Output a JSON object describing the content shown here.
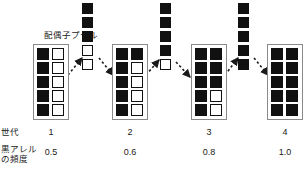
{
  "figure": {
    "title_label": "配偶子プール",
    "row_labels": {
      "generation": "世代",
      "allele_freq_line1": "黒アレル",
      "allele_freq_line2": "の頻度"
    }
  },
  "chart_data": {
    "type": "diagram",
    "title": "配偶子プール",
    "generations": [
      {
        "index": "1",
        "generation_label": "1",
        "black_allele_frequency": "0.5",
        "frequency_value": 0.5,
        "rows": [
          [
            "black",
            "white"
          ],
          [
            "black",
            "white"
          ],
          [
            "black",
            "white"
          ],
          [
            "black",
            "white"
          ],
          [
            "black",
            "white"
          ]
        ]
      },
      {
        "index": "2",
        "generation_label": "2",
        "black_allele_frequency": "0.6",
        "frequency_value": 0.6,
        "rows": [
          [
            "black",
            "black"
          ],
          [
            "black",
            "white"
          ],
          [
            "black",
            "white"
          ],
          [
            "black",
            "white"
          ],
          [
            "black",
            "white"
          ]
        ]
      },
      {
        "index": "3",
        "generation_label": "3",
        "black_allele_frequency": "0.8",
        "frequency_value": 0.8,
        "rows": [
          [
            "black",
            "black"
          ],
          [
            "black",
            "black"
          ],
          [
            "black",
            "black"
          ],
          [
            "black",
            "white"
          ],
          [
            "black",
            "white"
          ]
        ]
      },
      {
        "index": "4",
        "generation_label": "4",
        "black_allele_frequency": "1.0",
        "frequency_value": 1.0,
        "rows": [
          [
            "black",
            "black"
          ],
          [
            "black",
            "black"
          ],
          [
            "black",
            "black"
          ],
          [
            "black",
            "black"
          ],
          [
            "black",
            "black"
          ]
        ]
      }
    ],
    "gamete_pools": [
      {
        "index": "1",
        "cells": [
          "black",
          "black",
          "black",
          "white",
          "white"
        ]
      },
      {
        "index": "2",
        "cells": [
          "black",
          "black",
          "black",
          "black",
          "white"
        ]
      },
      {
        "index": "3",
        "cells": [
          "black",
          "black",
          "black",
          "black",
          "black"
        ]
      }
    ],
    "colors": {
      "allele_black": "#111111",
      "allele_white": "#ffffff",
      "box_border": "#8a8a8a",
      "arrow": "#1a1a1a",
      "background": "#ffffff"
    }
  }
}
